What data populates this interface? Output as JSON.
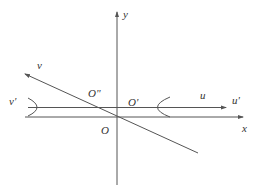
{
  "diagram": {
    "colors": {
      "line": "#555555",
      "text": "#333333",
      "background": "#ffffff"
    },
    "axes": {
      "y_axis": {
        "label": "y"
      },
      "x_axis": {
        "label": "x"
      },
      "u_axis": {
        "label": "u"
      },
      "u_prime_axis": {
        "label": "u'"
      },
      "v_axis": {
        "label": "v"
      },
      "v_prime_axis": {
        "label": "v'"
      }
    },
    "points": {
      "origin": {
        "label": "O"
      },
      "o_prime": {
        "label": "O'"
      },
      "o_double_prime": {
        "label": "O\""
      }
    },
    "curves": [
      {
        "name": "hyperbola-left-branch"
      },
      {
        "name": "hyperbola-right-branch"
      }
    ]
  }
}
